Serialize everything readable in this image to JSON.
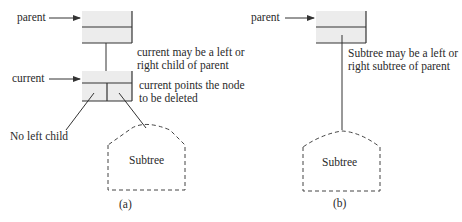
{
  "diagram_a": {
    "caption": "(a)",
    "labels": {
      "parent": "parent",
      "current": "current",
      "current_note_line1": "current may be a left or",
      "current_note_line2": "right child of parent",
      "delete_note_line1": "current points the node",
      "delete_note_line2": "to be deleted",
      "no_left_child": "No left child",
      "subtree": "Subtree"
    }
  },
  "diagram_b": {
    "caption": "(b)",
    "labels": {
      "parent": "parent",
      "subtree_note_line1": "Subtree may be a left or",
      "subtree_note_line2": "right subtree of parent",
      "subtree": "Subtree"
    }
  },
  "colors": {
    "node_fill": "#ececec",
    "line": "#333333"
  }
}
